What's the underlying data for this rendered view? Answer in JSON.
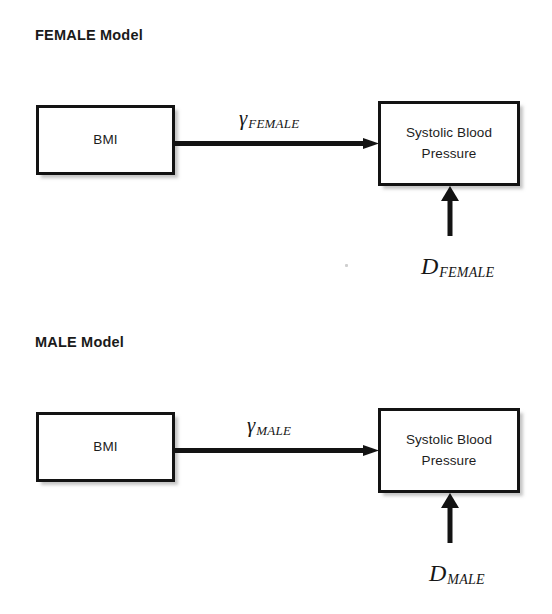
{
  "document": {
    "type": "path-diagram",
    "background_color": "#ffffff",
    "line_color": "#131313",
    "text_color": "#1a1a1a"
  },
  "panels": [
    {
      "id": "female",
      "title": "FEMALE Model",
      "nodes": {
        "predictor": "BMI",
        "outcome_line1": "Systolic Blood",
        "outcome_line2": "Pressure"
      },
      "path_label": {
        "base": "γ",
        "subscript": "FEMALE"
      },
      "disturbance_label": {
        "base": "D",
        "subscript": "FEMALE"
      }
    },
    {
      "id": "male",
      "title": "MALE Model",
      "nodes": {
        "predictor": "BMI",
        "outcome_line1": "Systolic Blood",
        "outcome_line2": "Pressure"
      },
      "path_label": {
        "base": "γ",
        "subscript": "MALE"
      },
      "disturbance_label": {
        "base": "D",
        "subscript": "MALE"
      }
    }
  ],
  "icons": {
    "path_arrow": "right-arrow-icon",
    "disturbance_arrow": "up-arrow-icon"
  }
}
